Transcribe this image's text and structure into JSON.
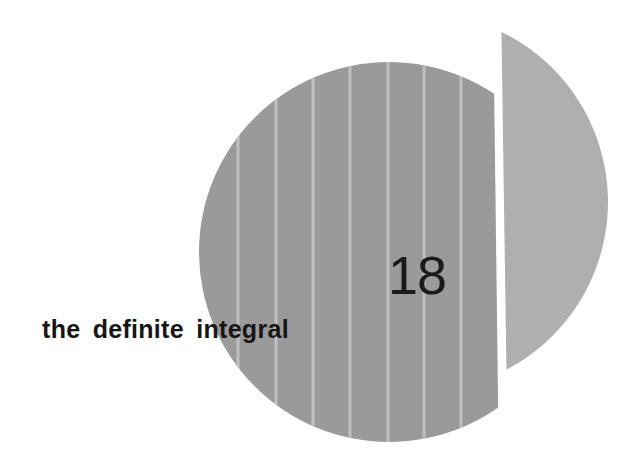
{
  "chapter": {
    "number": "18",
    "title": "the definite integral"
  },
  "artwork": {
    "main_disk": {
      "shape": "circle-left-segment",
      "center": [
        389,
        252
      ],
      "radius": 190,
      "cut_x_top": 493,
      "cut_x_bottom": 499,
      "color": "#9a9a9a"
    },
    "right_segment": {
      "shape": "circle-right-segment",
      "center": [
        419,
        202
      ],
      "radius": 189,
      "chord_x_top": 501,
      "chord_x_bottom": 508,
      "color": "#afafaf"
    },
    "stripes": {
      "color": "#bfbfbf",
      "width": 3,
      "x_positions": [
        238,
        276,
        313,
        350,
        388,
        424,
        461
      ]
    }
  }
}
